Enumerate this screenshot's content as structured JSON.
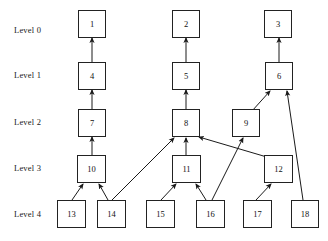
{
  "diagram": {
    "background_color": "#ffffff",
    "line_color": "#1a1a1a",
    "box_fill": "#ffffff",
    "box_border": "#222222",
    "levels": [
      {
        "id": "level-0",
        "label": "Level 0",
        "x": 14,
        "y": 25
      },
      {
        "id": "level-1",
        "label": "Level 1",
        "x": 14,
        "y": 70
      },
      {
        "id": "level-2",
        "label": "Level 2",
        "x": 14,
        "y": 117
      },
      {
        "id": "level-3",
        "label": "Level 3",
        "x": 14,
        "y": 163
      },
      {
        "id": "level-4",
        "label": "Level 4",
        "x": 14,
        "y": 209
      }
    ],
    "nodes": [
      {
        "id": "n1",
        "label": "1",
        "level": 0,
        "x": 78,
        "y": 10,
        "w": 28,
        "h": 28
      },
      {
        "id": "n2",
        "label": "2",
        "level": 0,
        "x": 172,
        "y": 10,
        "w": 28,
        "h": 28
      },
      {
        "id": "n3",
        "label": "3",
        "level": 0,
        "x": 264,
        "y": 10,
        "w": 28,
        "h": 28
      },
      {
        "id": "n4",
        "label": "4",
        "level": 1,
        "x": 78,
        "y": 62,
        "w": 28,
        "h": 28
      },
      {
        "id": "n5",
        "label": "5",
        "level": 1,
        "x": 172,
        "y": 62,
        "w": 28,
        "h": 28
      },
      {
        "id": "n6",
        "label": "6",
        "level": 1,
        "x": 265,
        "y": 62,
        "w": 28,
        "h": 28
      },
      {
        "id": "n7",
        "label": "7",
        "level": 2,
        "x": 78,
        "y": 109,
        "w": 28,
        "h": 28
      },
      {
        "id": "n8",
        "label": "8",
        "level": 2,
        "x": 172,
        "y": 109,
        "w": 28,
        "h": 28
      },
      {
        "id": "n9",
        "label": "9",
        "level": 2,
        "x": 232,
        "y": 109,
        "w": 28,
        "h": 28
      },
      {
        "id": "n10",
        "label": "10",
        "level": 3,
        "x": 77,
        "y": 155,
        "w": 29,
        "h": 28
      },
      {
        "id": "n11",
        "label": "11",
        "level": 3,
        "x": 172,
        "y": 155,
        "w": 29,
        "h": 28
      },
      {
        "id": "n12",
        "label": "12",
        "level": 3,
        "x": 264,
        "y": 155,
        "w": 29,
        "h": 28
      },
      {
        "id": "n13",
        "label": "13",
        "level": 4,
        "x": 57,
        "y": 200,
        "w": 29,
        "h": 28
      },
      {
        "id": "n14",
        "label": "14",
        "level": 4,
        "x": 97,
        "y": 200,
        "w": 29,
        "h": 28
      },
      {
        "id": "n15",
        "label": "15",
        "level": 4,
        "x": 146,
        "y": 200,
        "w": 29,
        "h": 28
      },
      {
        "id": "n16",
        "label": "16",
        "level": 4,
        "x": 196,
        "y": 200,
        "w": 29,
        "h": 28
      },
      {
        "id": "n17",
        "label": "17",
        "level": 4,
        "x": 243,
        "y": 200,
        "w": 29,
        "h": 28
      },
      {
        "id": "n18",
        "label": "18",
        "level": 4,
        "x": 291,
        "y": 200,
        "w": 28,
        "h": 28
      }
    ],
    "edges": [
      {
        "from": "n4",
        "to": "n1",
        "x1": 92,
        "y1": 62,
        "x2": 92,
        "y2": 38
      },
      {
        "from": "n5",
        "to": "n2",
        "x1": 186,
        "y1": 62,
        "x2": 186,
        "y2": 38
      },
      {
        "from": "n6",
        "to": "n3",
        "x1": 279,
        "y1": 62,
        "x2": 279,
        "y2": 38
      },
      {
        "from": "n7",
        "to": "n4",
        "x1": 92,
        "y1": 109,
        "x2": 92,
        "y2": 90
      },
      {
        "from": "n8",
        "to": "n5",
        "x1": 186,
        "y1": 109,
        "x2": 186,
        "y2": 90
      },
      {
        "from": "n9",
        "to": "n6",
        "x1": 252,
        "y1": 111,
        "x2": 270,
        "y2": 91
      },
      {
        "from": "n18",
        "to": "n6",
        "x1": 303,
        "y1": 200,
        "x2": 287,
        "y2": 91
      },
      {
        "from": "n10",
        "to": "n7",
        "x1": 92,
        "y1": 155,
        "x2": 92,
        "y2": 137
      },
      {
        "from": "n11",
        "to": "n8",
        "x1": 186,
        "y1": 155,
        "x2": 186,
        "y2": 138
      },
      {
        "from": "n12",
        "to": "n8",
        "x1": 277,
        "y1": 160,
        "x2": 199,
        "y2": 137
      },
      {
        "from": "n14",
        "to": "n8",
        "x1": 112,
        "y1": 200,
        "x2": 174,
        "y2": 138
      },
      {
        "from": "n13",
        "to": "n10",
        "x1": 72,
        "y1": 200,
        "x2": 83,
        "y2": 184
      },
      {
        "from": "n14",
        "to": "n10",
        "x1": 108,
        "y1": 200,
        "x2": 99,
        "y2": 184
      },
      {
        "from": "n15",
        "to": "n11",
        "x1": 161,
        "y1": 200,
        "x2": 176,
        "y2": 184
      },
      {
        "from": "n16",
        "to": "n11",
        "x1": 206,
        "y1": 200,
        "x2": 196,
        "y2": 184
      },
      {
        "from": "n16",
        "to": "n9",
        "x1": 212,
        "y1": 200,
        "x2": 243,
        "y2": 138
      },
      {
        "from": "n17",
        "to": "n12",
        "x1": 256,
        "y1": 200,
        "x2": 271,
        "y2": 184
      }
    ]
  }
}
